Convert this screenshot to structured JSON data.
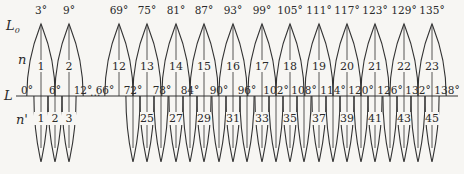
{
  "labels": {
    "upper_axis": "L",
    "upper_axis_sub": "0",
    "base_axis": "L",
    "upper_row": "n",
    "lower_row": "n'",
    "ellipsis": "…"
  },
  "colors": {
    "stroke": "#333333",
    "background": "#f7f6f3",
    "text": "#2a2a2a"
  },
  "geometry": {
    "baseline_y": 96,
    "baseline_x0": 16,
    "baseline_x1": 458,
    "upper_peak_y": 22,
    "lower_bottom_y": 162,
    "px_per_degree": 4.74,
    "origin_x": 27,
    "gap_shift_x": -208
  },
  "upper_arches": [
    {
      "peak": "3°",
      "deg": 3,
      "x": 41,
      "n": "1"
    },
    {
      "peak": "9°",
      "deg": 9,
      "x": 69,
      "n": "2"
    },
    {
      "peak": "69°",
      "deg": 69,
      "x": 119,
      "n": "12"
    },
    {
      "peak": "75°",
      "deg": 75,
      "x": 147,
      "n": "13"
    },
    {
      "peak": "81°",
      "deg": 81,
      "x": 176,
      "n": "14"
    },
    {
      "peak": "87°",
      "deg": 87,
      "x": 204,
      "n": "15"
    },
    {
      "peak": "93°",
      "deg": 93,
      "x": 233,
      "n": "16"
    },
    {
      "peak": "99°",
      "deg": 99,
      "x": 262,
      "n": "17"
    },
    {
      "peak": "105°",
      "deg": 105,
      "x": 290,
      "n": "18"
    },
    {
      "peak": "111°",
      "deg": 111,
      "x": 319,
      "n": "19"
    },
    {
      "peak": "117°",
      "deg": 117,
      "x": 347,
      "n": "20"
    },
    {
      "peak": "123°",
      "deg": 123,
      "x": 375,
      "n": "21"
    },
    {
      "peak": "129°",
      "deg": 129,
      "x": 404,
      "n": "22"
    },
    {
      "peak": "135°",
      "deg": 135,
      "x": 432,
      "n": "23"
    }
  ],
  "base_ticks": [
    {
      "label": "0°",
      "x": 27
    },
    {
      "label": "6°",
      "x": 55
    },
    {
      "label": "12°",
      "x": 83
    },
    {
      "label": "66°",
      "x": 105
    },
    {
      "label": "72°",
      "x": 133
    },
    {
      "label": "78°",
      "x": 162
    },
    {
      "label": "84°",
      "x": 190
    },
    {
      "label": "90°",
      "x": 219
    },
    {
      "label": "96°",
      "x": 247
    },
    {
      "label": "102°",
      "x": 276
    },
    {
      "label": "108°",
      "x": 304
    },
    {
      "label": "114°",
      "x": 333
    },
    {
      "label": "120°",
      "x": 361
    },
    {
      "label": "126°",
      "x": 390
    },
    {
      "label": "132°",
      "x": 418
    },
    {
      "label": "138°",
      "x": 447
    }
  ],
  "lower_arches": [
    {
      "x": 41,
      "n": "1"
    },
    {
      "x": 55,
      "n": "2"
    },
    {
      "x": 69,
      "n": "3"
    },
    {
      "x": 133,
      "n": ""
    },
    {
      "x": 147,
      "n": "25"
    },
    {
      "x": 161,
      "n": ""
    },
    {
      "x": 176,
      "n": "27"
    },
    {
      "x": 190,
      "n": ""
    },
    {
      "x": 204,
      "n": "29"
    },
    {
      "x": 219,
      "n": ""
    },
    {
      "x": 233,
      "n": "31"
    },
    {
      "x": 247,
      "n": ""
    },
    {
      "x": 262,
      "n": "33"
    },
    {
      "x": 276,
      "n": ""
    },
    {
      "x": 290,
      "n": "35"
    },
    {
      "x": 304,
      "n": ""
    },
    {
      "x": 319,
      "n": "37"
    },
    {
      "x": 333,
      "n": ""
    },
    {
      "x": 347,
      "n": "39"
    },
    {
      "x": 361,
      "n": ""
    },
    {
      "x": 375,
      "n": "41"
    },
    {
      "x": 390,
      "n": ""
    },
    {
      "x": 404,
      "n": "43"
    },
    {
      "x": 418,
      "n": ""
    },
    {
      "x": 432,
      "n": "45"
    }
  ]
}
